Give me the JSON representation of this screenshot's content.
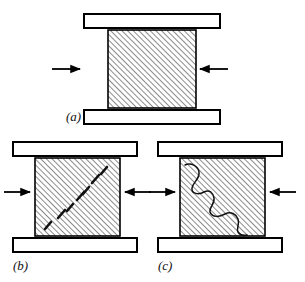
{
  "figure": {
    "background_color": "#ffffff",
    "line_color": "#000000",
    "hatch_color": "#2b2b2b",
    "platen_fill": "#ffffff",
    "width": 305,
    "height": 282
  },
  "panels": [
    {
      "id": "a",
      "label": "(a)",
      "label_x": 66,
      "label_y": 121,
      "caption": "Intact specimen under uniaxial compression between rigid platens",
      "specimen": {
        "x": 108,
        "y": 30,
        "width": 88,
        "height": 78
      },
      "top_platen": {
        "x": 84,
        "y": 14,
        "width": 136,
        "height": 14
      },
      "bottom_platen": {
        "x": 84,
        "y": 110,
        "width": 136,
        "height": 14
      },
      "arrows": [
        {
          "name": "left-load-arrow",
          "direction": "right",
          "x1": 52,
          "y1": 69,
          "x2": 80,
          "y2": 69
        },
        {
          "name": "right-load-arrow",
          "direction": "left",
          "x1": 228,
          "y1": 69,
          "x2": 200,
          "y2": 69
        }
      ],
      "damage": {
        "type": "none",
        "marks": []
      }
    },
    {
      "id": "b",
      "label": "(b)",
      "label_x": 13,
      "label_y": 270,
      "caption": "Microcracks coalescing along an incipient diagonal shear band",
      "specimen": {
        "x": 35,
        "y": 158,
        "width": 85,
        "height": 78
      },
      "top_platen": {
        "x": 13,
        "y": 142,
        "width": 124,
        "height": 14
      },
      "bottom_platen": {
        "x": 13,
        "y": 238,
        "width": 124,
        "height": 14
      },
      "arrows": [
        {
          "name": "left-load-arrow",
          "direction": "right",
          "x1": 4,
          "y1": 192,
          "x2": 30,
          "y2": 192
        },
        {
          "name": "right-load-arrow",
          "direction": "left",
          "x1": 151,
          "y1": 192,
          "x2": 125,
          "y2": 192
        }
      ],
      "damage": {
        "type": "dashed-microcracks",
        "marks": [
          {
            "x1": 45,
            "y1": 229,
            "x2": 51,
            "y2": 222
          },
          {
            "x1": 58,
            "y1": 218,
            "x2": 65,
            "y2": 210
          },
          {
            "x1": 67,
            "y1": 211,
            "x2": 73,
            "y2": 204
          },
          {
            "x1": 77,
            "y1": 200,
            "x2": 84,
            "y2": 192
          },
          {
            "x1": 83,
            "y1": 194,
            "x2": 89,
            "y2": 187
          },
          {
            "x1": 92,
            "y1": 183,
            "x2": 99,
            "y2": 175
          },
          {
            "x1": 101,
            "y1": 174,
            "x2": 107,
            "y2": 167
          }
        ]
      }
    },
    {
      "id": "c",
      "label": "(c)",
      "label_x": 158,
      "label_y": 270,
      "caption": "Fully developed continuous diagonal shear fracture",
      "specimen": {
        "x": 180,
        "y": 158,
        "width": 85,
        "height": 78
      },
      "top_platen": {
        "x": 158,
        "y": 142,
        "width": 124,
        "height": 14
      },
      "bottom_platen": {
        "x": 158,
        "y": 238,
        "width": 124,
        "height": 14
      },
      "arrows": [
        {
          "name": "left-load-arrow",
          "direction": "right",
          "x1": 149,
          "y1": 192,
          "x2": 175,
          "y2": 192
        },
        {
          "name": "right-load-arrow",
          "direction": "left",
          "x1": 296,
          "y1": 192,
          "x2": 270,
          "y2": 192
        }
      ],
      "damage": {
        "type": "continuous-fracture",
        "path": "M 185 165 C 191 162 198 166 199 172 C 200 179 193 182 192 188 C 191 194 199 195 204 192 C 210 189 213 193 214 198 C 215 204 209 207 210 212 C 212 218 220 217 225 214 C 231 211 236 214 238 219 C 240 224 236 228 238 232 C 240 235 243 236 247 235"
      }
    }
  ],
  "hatching": {
    "angle_degrees": 45,
    "spacing_px": 4,
    "stroke_width": 1.1,
    "description": "dense 45-degree section hatching rising left to right"
  }
}
